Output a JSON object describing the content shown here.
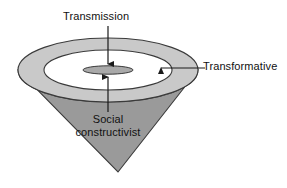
{
  "diagram": {
    "type": "concept-diagram",
    "background_color": "#ffffff",
    "labels": {
      "transmission": "Transmission",
      "transformative": "Transformative",
      "social_line1": "Social",
      "social_line2": "constructivist"
    },
    "colors": {
      "ring_top": "#c9c9c9",
      "cone_body": "#9a9a9a",
      "inner_disc": "#ffffff",
      "center_ellipse": "#a9a9a9",
      "outline": "#3a3a3a",
      "text": "#111111",
      "arrow": "#1a1a1a"
    },
    "shapes": {
      "outer_ellipse": {
        "cx": 108,
        "cy": 70,
        "rx": 90,
        "ry": 32
      },
      "inner_disc": {
        "cx": 108,
        "cy": 70,
        "rx": 64,
        "ry": 20
      },
      "center_ellipse": {
        "cx": 108,
        "cy": 70,
        "rx": 25,
        "ry": 4
      },
      "cone_apex": {
        "x": 118,
        "y": 172
      },
      "cone_rim_y": 86
    },
    "arrows": [
      {
        "name": "transmission-arrow",
        "from": [
          108,
          26
        ],
        "to": [
          108,
          64
        ],
        "direction": "down"
      },
      {
        "name": "social-constructivist-arrow",
        "from": [
          108,
          112
        ],
        "to": [
          108,
          77
        ],
        "direction": "up"
      },
      {
        "name": "transformative-arrow",
        "from": [
          205,
          68
        ],
        "to": [
          161,
          68
        ],
        "direction": "left"
      }
    ]
  }
}
